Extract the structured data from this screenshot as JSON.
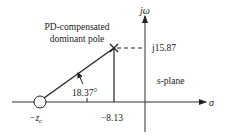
{
  "diagram": {
    "type": "s-plane root locus geometry",
    "plane_label": "s-plane",
    "axes": {
      "real_axis_label": "σ",
      "imag_axis_label": "jω"
    },
    "pole": {
      "label_line1": "PD-compensated",
      "label_line2": "dominant pole",
      "real_part": -8.13,
      "imag_part": 15.87,
      "imag_label": "j15.87",
      "real_label": "−8.13",
      "marker": "x-mark"
    },
    "zero": {
      "label": "−z",
      "label_subscript": "c",
      "marker": "open-circle"
    },
    "angle": {
      "label": "18.37°",
      "value_deg": 18.37
    },
    "colors": {
      "line": "#222222",
      "background": "#ffffff"
    }
  }
}
